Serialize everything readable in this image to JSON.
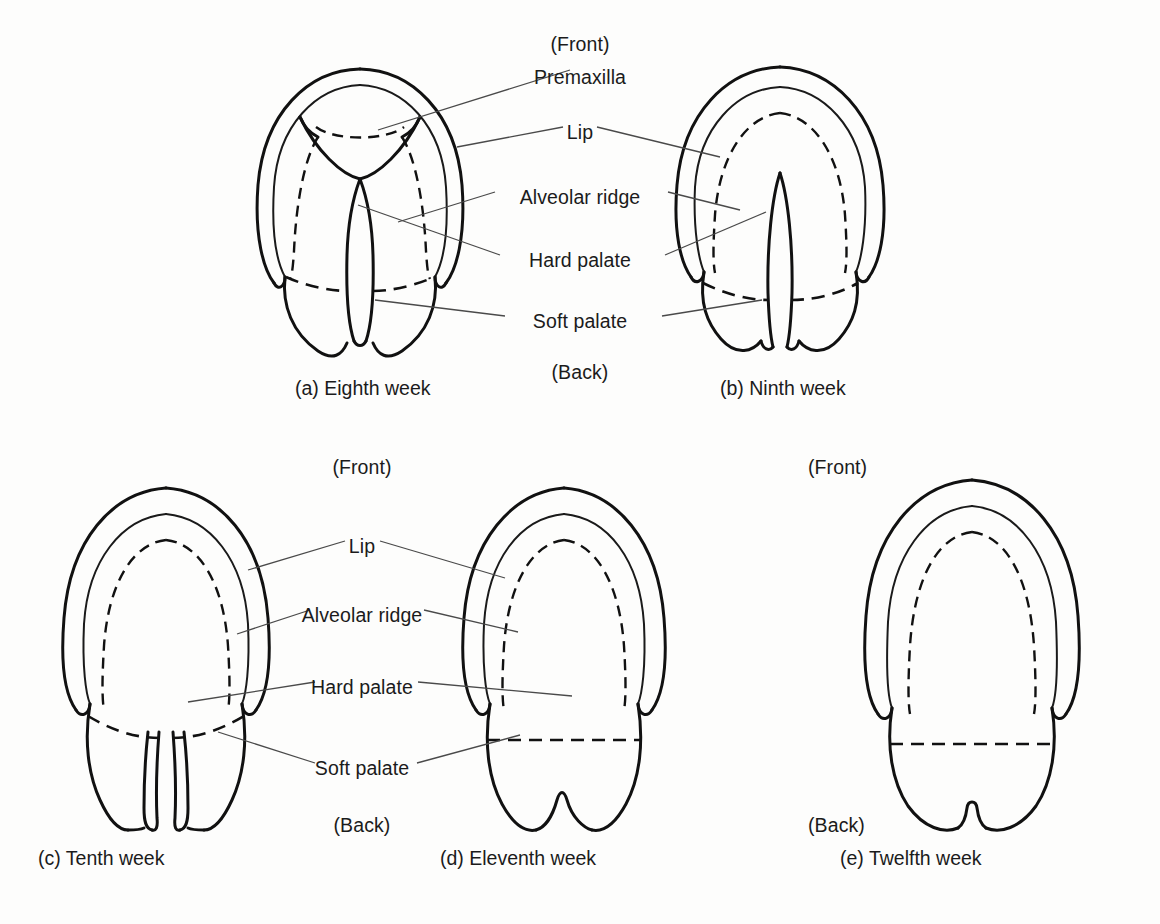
{
  "figure": {
    "orientation_labels": {
      "front": "(Front)",
      "back": "(Back)"
    },
    "structure_labels": {
      "premaxilla": "Premaxilla",
      "lip": "Lip",
      "alveolar_ridge": "Alveolar ridge",
      "hard_palate": "Hard palate",
      "soft_palate": "Soft palate"
    },
    "panels": [
      {
        "key": "a",
        "caption": "(a) Eighth week",
        "week": 8,
        "description": "Wide open cleft of the entire secondary palate with prominent premaxilla and triangular vomer"
      },
      {
        "key": "b",
        "caption": "(b) Ninth week",
        "week": 9,
        "description": "Palatal shelves elevating; narrow midline cleft remains through hard and soft palate"
      },
      {
        "key": "c",
        "caption": "(c) Tenth week",
        "week": 10,
        "description": "Hard palate largely fused; narrow cleft persists in the soft palate and uvula"
      },
      {
        "key": "d",
        "caption": "(d) Eleventh week",
        "week": 11,
        "description": "Fusion nearly complete; only a small notch between the two halves of the uvula"
      },
      {
        "key": "e",
        "caption": "(e) Twelfth week",
        "week": 12,
        "description": "Palate fully fused; single midline uvula"
      }
    ],
    "top_row_labels": [
      {
        "name": "front",
        "text": "(Front)",
        "x": 580,
        "y": 43
      },
      {
        "name": "premaxilla",
        "text": "Premaxilla",
        "x": 580,
        "y": 76
      },
      {
        "name": "lip",
        "text": "Lip",
        "x": 580,
        "y": 131
      },
      {
        "name": "alveolar-ridge",
        "text": "Alveolar ridge",
        "x": 580,
        "y": 196
      },
      {
        "name": "hard-palate",
        "text": "Hard palate",
        "x": 580,
        "y": 259
      },
      {
        "name": "soft-palate",
        "text": "Soft palate",
        "x": 580,
        "y": 320
      },
      {
        "name": "back",
        "text": "(Back)",
        "x": 580,
        "y": 371
      }
    ],
    "bottom_row_labels": [
      {
        "name": "front",
        "text": "(Front)",
        "x": 362,
        "y": 466
      },
      {
        "name": "lip",
        "text": "Lip",
        "x": 362,
        "y": 545
      },
      {
        "name": "alveolar-ridge",
        "text": "Alveolar ridge",
        "x": 362,
        "y": 614
      },
      {
        "name": "hard-palate",
        "text": "Hard palate",
        "x": 362,
        "y": 686
      },
      {
        "name": "soft-palate",
        "text": "Soft palate",
        "x": 362,
        "y": 767
      },
      {
        "name": "back",
        "text": "(Back)",
        "x": 362,
        "y": 824
      }
    ],
    "panel_e_labels": [
      {
        "name": "front",
        "text": "(Front)",
        "x": 845,
        "y": 466
      },
      {
        "name": "back",
        "text": "(Back)",
        "x": 845,
        "y": 824
      }
    ],
    "captions": [
      {
        "key": "a",
        "text": "(a) Eighth week",
        "x": 295,
        "y": 386
      },
      {
        "key": "b",
        "text": "(b) Ninth week",
        "x": 720,
        "y": 386
      },
      {
        "key": "c",
        "text": "(c) Tenth week",
        "x": 38,
        "y": 856
      },
      {
        "key": "d",
        "text": "(d) Eleventh week",
        "x": 440,
        "y": 856
      },
      {
        "key": "e",
        "text": "(e) Twelfth week",
        "x": 840,
        "y": 856
      }
    ],
    "colors": {
      "background": "#fdfdfc",
      "ink": "#111111",
      "leader": "#4a4a4a",
      "text": "#1b1b1b"
    }
  }
}
